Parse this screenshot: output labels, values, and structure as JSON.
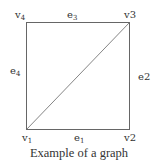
{
  "diagram": {
    "caption": "Example of a graph",
    "colors": {
      "edge": "#666666",
      "text": "#333333",
      "background": "#ffffff"
    },
    "vertices": [
      {
        "id": "v1",
        "base": "v",
        "index": "1",
        "style": "subscript",
        "position": "bottom-left"
      },
      {
        "id": "v2",
        "base": "v2",
        "index": "",
        "style": "inline",
        "position": "bottom-right"
      },
      {
        "id": "v3",
        "base": "v3",
        "index": "",
        "style": "inline",
        "position": "top-right"
      },
      {
        "id": "v4",
        "base": "v",
        "index": "4",
        "style": "subscript",
        "position": "top-left"
      }
    ],
    "edges": [
      {
        "id": "e1",
        "base": "e",
        "index": "1",
        "style": "subscript",
        "from": "v1",
        "to": "v2",
        "side": "bottom"
      },
      {
        "id": "e2",
        "base": "e2",
        "index": "",
        "style": "inline",
        "from": "v2",
        "to": "v3",
        "side": "right"
      },
      {
        "id": "e3",
        "base": "e",
        "index": "3",
        "style": "subscript",
        "from": "v3",
        "to": "v4",
        "side": "top"
      },
      {
        "id": "e4",
        "base": "e",
        "index": "4",
        "style": "subscript",
        "from": "v4",
        "to": "v1",
        "side": "left"
      },
      {
        "id": "e5",
        "from": "v1",
        "to": "v3",
        "side": "diagonal",
        "labeled": false
      }
    ]
  }
}
